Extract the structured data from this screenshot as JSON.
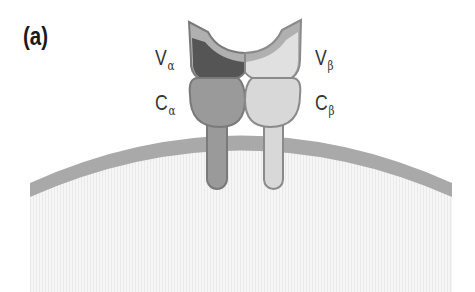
{
  "figure": {
    "panel_label": "(a)",
    "labels": {
      "v_alpha": {
        "main": "V",
        "sub": "α"
      },
      "c_alpha": {
        "main": "C",
        "sub": "α"
      },
      "v_beta": {
        "main": "V",
        "sub": "β"
      },
      "c_beta": {
        "main": "C",
        "sub": "β"
      }
    },
    "colors": {
      "membrane": "#a9a9a9",
      "cytoplasm": "#f3f3f3",
      "alpha_variable": "#555555",
      "alpha_constant": "#9a9a9a",
      "alpha_outline": "#7a7a7a",
      "beta_variable": "#dcdcdc",
      "beta_constant": "#d8d8d8",
      "beta_outline": "#8a8a8a",
      "cdr_rim": "#b0b0b0"
    }
  }
}
